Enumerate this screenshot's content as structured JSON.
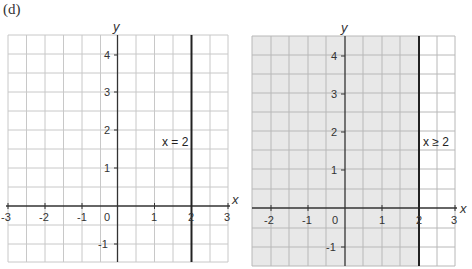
{
  "part_label": "(d)",
  "graphs": [
    {
      "id": "left",
      "axis_labels": {
        "x": "x",
        "y": "y"
      },
      "x_ticks": [
        "-3",
        "-2",
        "-1",
        "0",
        "1",
        "2",
        "3"
      ],
      "y_ticks": [
        "4",
        "3",
        "2",
        "1",
        "-1"
      ],
      "line_label": "x = 2",
      "shaded": false
    },
    {
      "id": "right",
      "axis_labels": {
        "x": "x",
        "y": "y"
      },
      "x_ticks": [
        "-2",
        "-1",
        "0",
        "1",
        "2",
        "3"
      ],
      "y_ticks": [
        "4",
        "3",
        "2",
        "1",
        "-1"
      ],
      "line_label": "x ≥ 2",
      "shaded": true,
      "shade_color": "#e8e8e8"
    }
  ],
  "colors": {
    "grid": "#c8c8c8",
    "axis": "#333333",
    "boundary": "#222222",
    "shade": "#e8e8e8"
  }
}
